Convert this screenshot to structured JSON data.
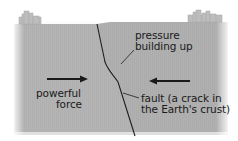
{
  "diagram": {
    "labels": {
      "pressure": [
        "pressure",
        "building up"
      ],
      "force": [
        "powerful",
        "force"
      ],
      "fault": [
        "fault (a crack in",
        "the Earth's crust)"
      ]
    },
    "colors": {
      "crust": "#b4b4b4",
      "crust_dark": "#a2a2a2",
      "building": "#bdbdbd",
      "fault_line": "#1e1e1e",
      "arrow": "#1a1a1a",
      "text": "#1a1a1a"
    }
  }
}
